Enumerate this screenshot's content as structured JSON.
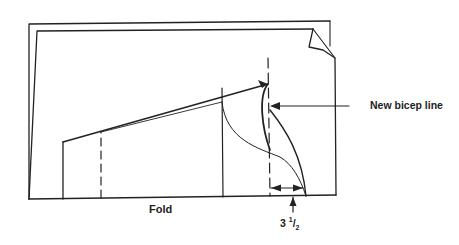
{
  "diagram": {
    "type": "sewing pattern — sleeve adjustment",
    "labels": {
      "fold": "Fold",
      "new_bicep_line": "New bicep line",
      "measurement_whole": "3",
      "measurement_num": "1",
      "measurement_den": "2"
    },
    "colors": {
      "line": "#222222",
      "background": "#ffffff"
    }
  }
}
